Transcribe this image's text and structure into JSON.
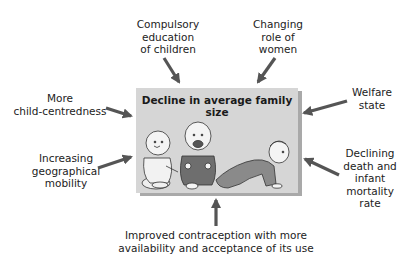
{
  "diagram": {
    "center": {
      "title": "Decline in average family size",
      "illustration": "three babies (sitting, sitting, crawling)"
    },
    "factors": [
      {
        "id": "compulsory-education",
        "lines": [
          "Compulsory",
          "education",
          "of children"
        ],
        "position": "top-left"
      },
      {
        "id": "changing-role-women",
        "lines": [
          "Changing",
          "role of",
          "women"
        ],
        "position": "top-right"
      },
      {
        "id": "child-centredness",
        "lines": [
          "More",
          "child-centredness"
        ],
        "position": "left-top"
      },
      {
        "id": "geographical-mobility",
        "lines": [
          "Increasing",
          "geographical",
          "mobility"
        ],
        "position": "left-bottom"
      },
      {
        "id": "welfare-state",
        "lines": [
          "Welfare",
          "state"
        ],
        "position": "right-top"
      },
      {
        "id": "declining-mortality",
        "lines": [
          "Declining",
          "death and",
          "infant",
          "mortality",
          "rate"
        ],
        "position": "right-bottom"
      },
      {
        "id": "contraception",
        "lines": [
          "Improved contraception with more",
          "availability and acceptance of its use"
        ],
        "position": "bottom"
      }
    ],
    "colors": {
      "box_fill": "#d6d6d6",
      "box_shadow": "#a9a9a9",
      "arrow": "#555555",
      "text": "#222222"
    }
  }
}
